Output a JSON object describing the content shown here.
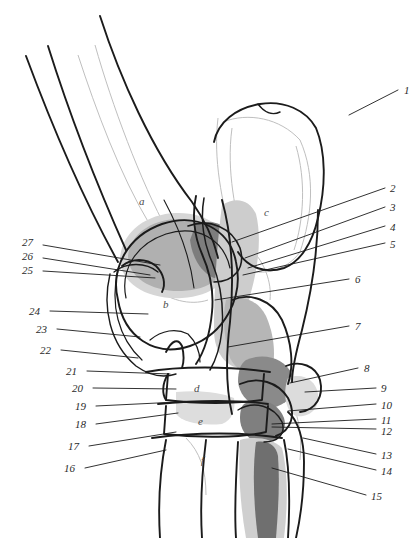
{
  "figure": {
    "kind": "anatomical-illustration",
    "width": 419,
    "height": 538,
    "background_color": "#ffffff",
    "ink_color": "#1a1a1a",
    "ghost_outline_color": "#b9b9b9",
    "shade_light": "#d9d9d9",
    "shade_mid": "#b3b3b3",
    "shade_dark": "#8c8c8c",
    "shade_darkest": "#6e6e6e"
  },
  "region_letters": [
    {
      "text": "a",
      "x": 139,
      "y": 196
    },
    {
      "text": "b",
      "x": 163,
      "y": 299
    },
    {
      "text": "c",
      "x": 264,
      "y": 207
    },
    {
      "text": "d",
      "x": 194,
      "y": 383
    },
    {
      "text": "e",
      "x": 198,
      "y": 416
    },
    {
      "text": "f",
      "x": 201,
      "y": 455
    }
  ],
  "labels_right": [
    {
      "text": "1",
      "x": 404,
      "y": 85,
      "lx1": 349,
      "ly1": 115,
      "lx2": 398,
      "ly2": 90
    },
    {
      "text": "2",
      "x": 390,
      "y": 183,
      "lx1": 232,
      "ly1": 242,
      "lx2": 385,
      "ly2": 188
    },
    {
      "text": "3",
      "x": 390,
      "y": 202,
      "lx1": 245,
      "ly1": 258,
      "lx2": 385,
      "ly2": 207
    },
    {
      "text": "4",
      "x": 390,
      "y": 222,
      "lx1": 248,
      "ly1": 268,
      "lx2": 385,
      "ly2": 226
    },
    {
      "text": "5",
      "x": 390,
      "y": 239,
      "lx1": 243,
      "ly1": 275,
      "lx2": 385,
      "ly2": 243
    },
    {
      "text": "6",
      "x": 355,
      "y": 274,
      "lx1": 215,
      "ly1": 300,
      "lx2": 349,
      "ly2": 279
    },
    {
      "text": "7",
      "x": 355,
      "y": 321,
      "lx1": 228,
      "ly1": 347,
      "lx2": 349,
      "ly2": 326
    },
    {
      "text": "8",
      "x": 364,
      "y": 363,
      "lx1": 290,
      "ly1": 383,
      "lx2": 358,
      "ly2": 368
    },
    {
      "text": "9",
      "x": 381,
      "y": 383,
      "lx1": 305,
      "ly1": 392,
      "lx2": 376,
      "ly2": 388
    },
    {
      "text": "10",
      "x": 381,
      "y": 400,
      "lx1": 288,
      "ly1": 411,
      "lx2": 376,
      "ly2": 404
    },
    {
      "text": "11",
      "x": 381,
      "y": 415,
      "lx1": 272,
      "ly1": 424,
      "lx2": 376,
      "ly2": 419
    },
    {
      "text": "12",
      "x": 381,
      "y": 426,
      "lx1": 272,
      "ly1": 427,
      "lx2": 376,
      "ly2": 429
    },
    {
      "text": "13",
      "x": 381,
      "y": 450,
      "lx1": 303,
      "ly1": 438,
      "lx2": 376,
      "ly2": 454
    },
    {
      "text": "14",
      "x": 381,
      "y": 466,
      "lx1": 288,
      "ly1": 449,
      "lx2": 376,
      "ly2": 470
    },
    {
      "text": "15",
      "x": 371,
      "y": 491,
      "lx1": 272,
      "ly1": 468,
      "lx2": 366,
      "ly2": 495
    }
  ],
  "labels_left": [
    {
      "text": "27",
      "x": 22,
      "y": 237,
      "lx1": 43,
      "ly1": 245,
      "lx2": 160,
      "ly2": 265
    },
    {
      "text": "26",
      "x": 22,
      "y": 251,
      "lx1": 43,
      "ly1": 258,
      "lx2": 150,
      "ly2": 275
    },
    {
      "text": "25",
      "x": 22,
      "y": 265,
      "lx1": 43,
      "ly1": 271,
      "lx2": 155,
      "ly2": 278
    },
    {
      "text": "24",
      "x": 29,
      "y": 306,
      "lx1": 50,
      "ly1": 311,
      "lx2": 148,
      "ly2": 314
    },
    {
      "text": "23",
      "x": 36,
      "y": 324,
      "lx1": 57,
      "ly1": 329,
      "lx2": 140,
      "ly2": 337
    },
    {
      "text": "22",
      "x": 40,
      "y": 345,
      "lx1": 61,
      "ly1": 350,
      "lx2": 138,
      "ly2": 358
    },
    {
      "text": "21",
      "x": 66,
      "y": 366,
      "lx1": 87,
      "ly1": 371,
      "lx2": 170,
      "ly2": 374
    },
    {
      "text": "20",
      "x": 72,
      "y": 383,
      "lx1": 93,
      "ly1": 388,
      "lx2": 176,
      "ly2": 389
    },
    {
      "text": "19",
      "x": 75,
      "y": 401,
      "lx1": 96,
      "ly1": 406,
      "lx2": 178,
      "ly2": 402
    },
    {
      "text": "18",
      "x": 75,
      "y": 419,
      "lx1": 96,
      "ly1": 424,
      "lx2": 178,
      "ly2": 413
    },
    {
      "text": "17",
      "x": 68,
      "y": 441,
      "lx1": 89,
      "ly1": 446,
      "lx2": 176,
      "ly2": 432
    },
    {
      "text": "16",
      "x": 64,
      "y": 463,
      "lx1": 85,
      "ly1": 468,
      "lx2": 166,
      "ly2": 450
    }
  ]
}
